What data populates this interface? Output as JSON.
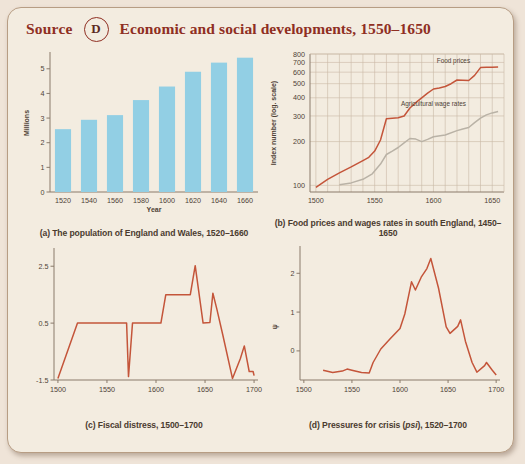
{
  "header": {
    "source_label": "Source",
    "badge_letter": "D",
    "title": "Economic and social developments, 1550–1650",
    "accent_color": "#8f2f23"
  },
  "chart_data": [
    {
      "id": "a",
      "type": "bar",
      "title": "",
      "caption": "(a) The population of England and Wales, 1520–1660",
      "xlabel": "Year",
      "ylabel": "Millions",
      "categories": [
        "1520",
        "1540",
        "1560",
        "1580",
        "1600",
        "1620",
        "1640",
        "1660"
      ],
      "values": [
        2.55,
        2.93,
        3.12,
        3.73,
        4.28,
        4.88,
        5.25,
        5.45
      ],
      "ylim": [
        0,
        5.6
      ],
      "yticks": [
        0,
        1,
        2,
        3,
        4,
        5
      ],
      "bar_color": "#92cfe4",
      "grid": false
    },
    {
      "id": "b",
      "type": "line",
      "caption": "(b) Food prices and wages rates in south England, 1450–1650",
      "xlabel": "",
      "ylabel": "Index number (log. scale)",
      "ylim": [
        90,
        800
      ],
      "yticks": [
        100,
        200,
        300,
        400,
        500,
        600,
        700,
        800
      ],
      "xlim": [
        1495,
        1660
      ],
      "xticks": [
        1500,
        1550,
        1600,
        1650
      ],
      "grid": true,
      "log_scale": true,
      "series": [
        {
          "name": "Food prices",
          "color": "#c4553a",
          "label_x": 1617,
          "label_y": 690,
          "points": [
            [
              1500,
              97
            ],
            [
              1510,
              110
            ],
            [
              1520,
              122
            ],
            [
              1530,
              134
            ],
            [
              1540,
              148
            ],
            [
              1545,
              156
            ],
            [
              1550,
              172
            ],
            [
              1555,
              205
            ],
            [
              1560,
              287
            ],
            [
              1570,
              292
            ],
            [
              1575,
              300
            ],
            [
              1580,
              340
            ],
            [
              1585,
              370
            ],
            [
              1590,
              400
            ],
            [
              1595,
              430
            ],
            [
              1600,
              460
            ],
            [
              1605,
              468
            ],
            [
              1610,
              478
            ],
            [
              1615,
              500
            ],
            [
              1620,
              530
            ],
            [
              1625,
              528
            ],
            [
              1630,
              526
            ],
            [
              1635,
              570
            ],
            [
              1640,
              645
            ],
            [
              1645,
              648
            ],
            [
              1650,
              648
            ],
            [
              1655,
              650
            ]
          ]
        },
        {
          "name": "Agricultural wage rates",
          "color": "#b9b2a6",
          "label_x": 1600,
          "label_y": 352,
          "points": [
            [
              1520,
              101
            ],
            [
              1530,
              104
            ],
            [
              1540,
              110
            ],
            [
              1548,
              120
            ],
            [
              1555,
              140
            ],
            [
              1560,
              163
            ],
            [
              1565,
              172
            ],
            [
              1570,
              182
            ],
            [
              1575,
              196
            ],
            [
              1580,
              210
            ],
            [
              1585,
              208
            ],
            [
              1590,
              200
            ],
            [
              1595,
              207
            ],
            [
              1600,
              216
            ],
            [
              1610,
              222
            ],
            [
              1620,
              238
            ],
            [
              1625,
              244
            ],
            [
              1630,
              250
            ],
            [
              1635,
              270
            ],
            [
              1640,
              290
            ],
            [
              1645,
              305
            ],
            [
              1650,
              315
            ],
            [
              1655,
              322
            ]
          ]
        }
      ]
    },
    {
      "id": "c",
      "type": "line",
      "caption": "(c) Fiscal distress, 1500–1700",
      "xlabel": "",
      "ylabel": "",
      "ylim": [
        -1.5,
        3.0
      ],
      "yticks": [
        -1.5,
        0.5,
        2.5
      ],
      "ytick_labels": [
        "-1.5",
        "0.5",
        "2.5"
      ],
      "xlim": [
        1496,
        1704
      ],
      "xticks": [
        1500,
        1550,
        1600,
        1650,
        1700
      ],
      "grid": false,
      "series": [
        {
          "name": "Fiscal distress",
          "color": "#c4553a",
          "points": [
            [
              1500,
              -1.45
            ],
            [
              1520,
              0.5
            ],
            [
              1565,
              0.5
            ],
            [
              1570,
              0.5
            ],
            [
              1572,
              -1.38
            ],
            [
              1576,
              0.5
            ],
            [
              1605,
              0.5
            ],
            [
              1610,
              1.5
            ],
            [
              1632,
              1.5
            ],
            [
              1635,
              1.5
            ],
            [
              1640,
              2.52
            ],
            [
              1648,
              0.5
            ],
            [
              1655,
              0.52
            ],
            [
              1658,
              1.55
            ],
            [
              1662,
              1.0
            ],
            [
              1668,
              0.1
            ],
            [
              1678,
              -1.45
            ],
            [
              1686,
              -0.75
            ],
            [
              1690,
              -0.3
            ],
            [
              1695,
              -1.2
            ],
            [
              1699,
              -1.2
            ],
            [
              1700,
              -1.35
            ]
          ]
        }
      ]
    },
    {
      "id": "d",
      "type": "line",
      "caption": "(d) Pressures for crisis (psi), 1520–1700",
      "caption_italic_part": "psi",
      "xlabel": "",
      "ylabel": "ψ",
      "ylim": [
        -0.75,
        2.6
      ],
      "yticks": [
        0,
        1,
        2
      ],
      "xlim": [
        1496,
        1704
      ],
      "xticks": [
        1500,
        1550,
        1600,
        1650,
        1700
      ],
      "grid": false,
      "series": [
        {
          "name": "Pressures for crisis",
          "color": "#c4553a",
          "points": [
            [
              1520,
              -0.5
            ],
            [
              1530,
              -0.56
            ],
            [
              1540,
              -0.52
            ],
            [
              1545,
              -0.47
            ],
            [
              1550,
              -0.5
            ],
            [
              1560,
              -0.56
            ],
            [
              1568,
              -0.57
            ],
            [
              1572,
              -0.3
            ],
            [
              1580,
              0.05
            ],
            [
              1590,
              0.32
            ],
            [
              1600,
              0.58
            ],
            [
              1605,
              0.95
            ],
            [
              1612,
              1.78
            ],
            [
              1616,
              1.57
            ],
            [
              1622,
              1.9
            ],
            [
              1628,
              2.12
            ],
            [
              1632,
              2.38
            ],
            [
              1640,
              1.62
            ],
            [
              1648,
              0.62
            ],
            [
              1652,
              0.45
            ],
            [
              1660,
              0.63
            ],
            [
              1663,
              0.8
            ],
            [
              1668,
              0.25
            ],
            [
              1675,
              -0.3
            ],
            [
              1680,
              -0.55
            ],
            [
              1688,
              -0.38
            ],
            [
              1690,
              -0.3
            ],
            [
              1696,
              -0.5
            ],
            [
              1700,
              -0.62
            ]
          ]
        }
      ]
    }
  ]
}
